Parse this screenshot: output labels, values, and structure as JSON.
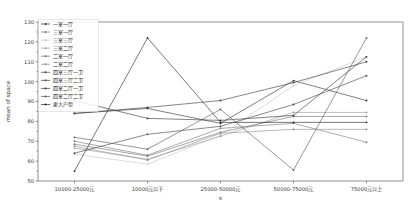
{
  "chart_data": {
    "type": "line",
    "title": "",
    "xlabel": "x",
    "ylabel": "mean of space",
    "ylim": [
      50,
      130
    ],
    "yticks": [
      50,
      60,
      70,
      80,
      90,
      100,
      110,
      120,
      130
    ],
    "grid": false,
    "legend_position": "upper-left",
    "marker": "point",
    "categories": [
      "10000-25000元",
      "10000元以下",
      "25000-50000元",
      "50000-75000元",
      "75000元以上"
    ],
    "series": [
      {
        "name": "一室一厅",
        "color": "#2f2f2f",
        "values": [
          84.0,
          86.5,
          79.0,
          100.5,
          90.5
        ]
      },
      {
        "name": "三室一厅",
        "color": "#7a7a7a",
        "values": [
          70.0,
          63.0,
          76.5,
          79.0,
          69.5
        ]
      },
      {
        "name": "三室三厅",
        "color": "#c6c6c6",
        "values": [
          63.5,
          58.5,
          73.0,
          98.0,
          112.5
        ]
      },
      {
        "name": "三室二厅",
        "color": "#9a9a9a",
        "values": [
          66.5,
          61.0,
          72.5,
          84.5,
          84.5
        ]
      },
      {
        "name": "二室一厅",
        "color": "#6e6e6e",
        "values": [
          68.5,
          62.5,
          74.5,
          82.5,
          82.5
        ]
      },
      {
        "name": "二室二厅",
        "color": "#8d8d8d",
        "values": [
          67.5,
          60.5,
          74.0,
          76.0,
          76.0
        ]
      },
      {
        "name": "四室三厅一卫",
        "color": "#434343",
        "values": [
          64.0,
          73.5,
          77.5,
          88.5,
          103.0
        ]
      },
      {
        "name": "四室三厅二卫",
        "color": "#3a3a3a",
        "values": [
          84.0,
          87.0,
          90.5,
          99.5,
          110.0
        ]
      },
      {
        "name": "四室二厅一卫",
        "color": "#353535",
        "values": [
          90.5,
          81.5,
          80.5,
          83.0,
          112.5
        ]
      },
      {
        "name": "四室二厅二卫",
        "color": "#585858",
        "values": [
          72.0,
          66.0,
          86.0,
          55.5,
          122.0
        ]
      },
      {
        "name": "更大户型",
        "color": "#262626",
        "values": [
          55.0,
          122.0,
          79.5,
          79.5,
          79.5
        ]
      }
    ]
  }
}
